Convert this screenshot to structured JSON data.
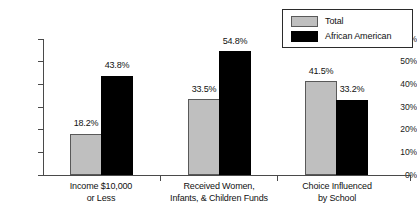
{
  "chart_data": {
    "type": "bar",
    "title": "",
    "xlabel": "",
    "ylabel": "",
    "ylim": [
      0,
      60
    ],
    "grid": false,
    "legend_position": "top-right",
    "categories": [
      "Income $10,000 or Less",
      "Received Women, Infants, & Children Funds",
      "Choice Influenced by School"
    ],
    "category_lines": [
      [
        "Income $10,000",
        "or Less"
      ],
      [
        "Received Women,",
        "Infants, & Children Funds"
      ],
      [
        "Choice Influenced",
        "by School"
      ]
    ],
    "series": [
      {
        "name": "Total",
        "color": "#bfbfbf",
        "values": [
          18.2,
          33.5,
          41.5
        ],
        "labels": [
          "18.2%",
          "33.5%",
          "41.5%"
        ]
      },
      {
        "name": "African American",
        "color": "#000000",
        "values": [
          43.8,
          54.8,
          33.2
        ],
        "labels": [
          "43.8%",
          "54.8%",
          "33.2%"
        ]
      }
    ],
    "y_ticks": [
      0,
      10,
      20,
      30,
      40,
      50,
      60
    ],
    "y_tick_labels": [
      "0%",
      "10%",
      "20%",
      "30%",
      "40%",
      "50%",
      "60%"
    ]
  },
  "legend": {
    "entries": [
      {
        "label": "Total",
        "swatch": "gray-swatch"
      },
      {
        "label": "African American",
        "swatch": "black-swatch"
      }
    ]
  }
}
